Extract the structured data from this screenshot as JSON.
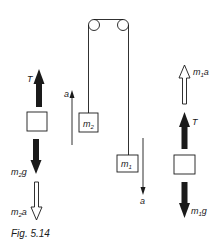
{
  "figure": {
    "caption": "Fig. 5.14"
  },
  "system": {
    "pulleys": 2,
    "mass_left": {
      "symbol": "m",
      "sub": "2"
    },
    "mass_right": {
      "symbol": "m",
      "sub": "1"
    },
    "accel_left": {
      "label": "a",
      "direction": "up"
    },
    "accel_right": {
      "label": "a",
      "direction": "down"
    }
  },
  "fbd_left": {
    "tension": {
      "label": "T",
      "direction": "up"
    },
    "weight": {
      "symbol": "m",
      "sub": "2",
      "suffix": "g",
      "direction": "down"
    },
    "inertial": {
      "symbol": "m",
      "sub": "2",
      "suffix": "a",
      "direction": "down"
    }
  },
  "fbd_right": {
    "inertial": {
      "symbol": "m",
      "sub": "1",
      "suffix": "a",
      "direction": "up"
    },
    "tension": {
      "label": "T",
      "direction": "up"
    },
    "weight": {
      "symbol": "m",
      "sub": "1",
      "suffix": "g",
      "direction": "down"
    }
  },
  "colors": {
    "ink": "#1a1a1a",
    "background": "#ffffff"
  }
}
